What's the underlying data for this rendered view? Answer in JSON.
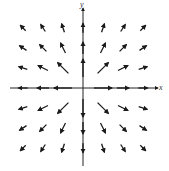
{
  "chart_data": {
    "type": "vector_field",
    "title": "",
    "xlabel": "x",
    "ylabel": "y",
    "field_description": "Radial outward field, magnitude decreasing with distance from origin (approx. F = (x, y)/(x^2 + y^2))",
    "grid": {
      "x": [
        -3,
        -2,
        -1,
        0,
        1,
        2,
        3
      ],
      "y": [
        -3,
        -2,
        -1,
        0,
        1,
        2,
        3
      ]
    },
    "xlim": [
      -4,
      4
    ],
    "ylim": [
      -4.3,
      4.3
    ],
    "color": "#1a1a1a"
  },
  "axes": {
    "x_label": "x",
    "y_label": "y"
  }
}
